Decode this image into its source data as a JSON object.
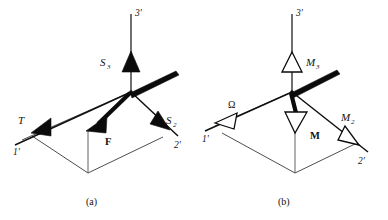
{
  "figure": {
    "background_color": "#ffffff",
    "ink_color": "#0b0b0b",
    "panels": [
      {
        "id": "a",
        "caption": "(a)",
        "axes": [
          {
            "name": "axis-1",
            "label": "1'"
          },
          {
            "name": "axis-2",
            "label": "2'"
          },
          {
            "name": "axis-3",
            "label": "3'"
          }
        ],
        "vectors": [
          {
            "name": "S3",
            "label": "S",
            "subscript": "3",
            "arrowhead": "solid",
            "direction": "up"
          },
          {
            "name": "T",
            "label": "T",
            "subscript": "",
            "arrowhead": "solid",
            "direction": "down-left"
          },
          {
            "name": "S2",
            "label": "S",
            "subscript": "2",
            "arrowhead": "solid",
            "direction": "down-right"
          },
          {
            "name": "F",
            "label": "F",
            "subscript": "",
            "arrowhead": "solid",
            "direction": "down-left",
            "style": "bold"
          }
        ]
      },
      {
        "id": "b",
        "caption": "(b)",
        "axes": [
          {
            "name": "axis-1",
            "label": "1'"
          },
          {
            "name": "axis-2",
            "label": "2'"
          },
          {
            "name": "axis-3",
            "label": "3'"
          }
        ],
        "vectors": [
          {
            "name": "M3",
            "label": "M",
            "subscript": "3",
            "arrowhead": "open",
            "direction": "up"
          },
          {
            "name": "Omega",
            "label": "Ω",
            "subscript": "",
            "arrowhead": "open",
            "direction": "down-left"
          },
          {
            "name": "M2",
            "label": "M",
            "subscript": "2",
            "arrowhead": "open",
            "direction": "down-right"
          },
          {
            "name": "M",
            "label": "M",
            "subscript": "",
            "arrowhead": "open",
            "direction": "down",
            "style": "bold"
          }
        ]
      }
    ]
  },
  "labels": {
    "a_axis3": "3'",
    "a_axis1": "1'",
    "a_axis2": "2'",
    "a_S3_main": "S",
    "a_S3_sub": "3",
    "a_T": "T",
    "a_S2_main": "S",
    "a_S2_sub": "2",
    "a_F": "F",
    "a_caption": "(a)",
    "b_axis3": "3'",
    "b_axis1": "1'",
    "b_axis2": "2'",
    "b_M3_main": "M",
    "b_M3_sub": "3",
    "b_omega": "Ω",
    "b_M2_main": "M",
    "b_M2_sub": "2",
    "b_M": "M",
    "b_caption": "(b)"
  }
}
